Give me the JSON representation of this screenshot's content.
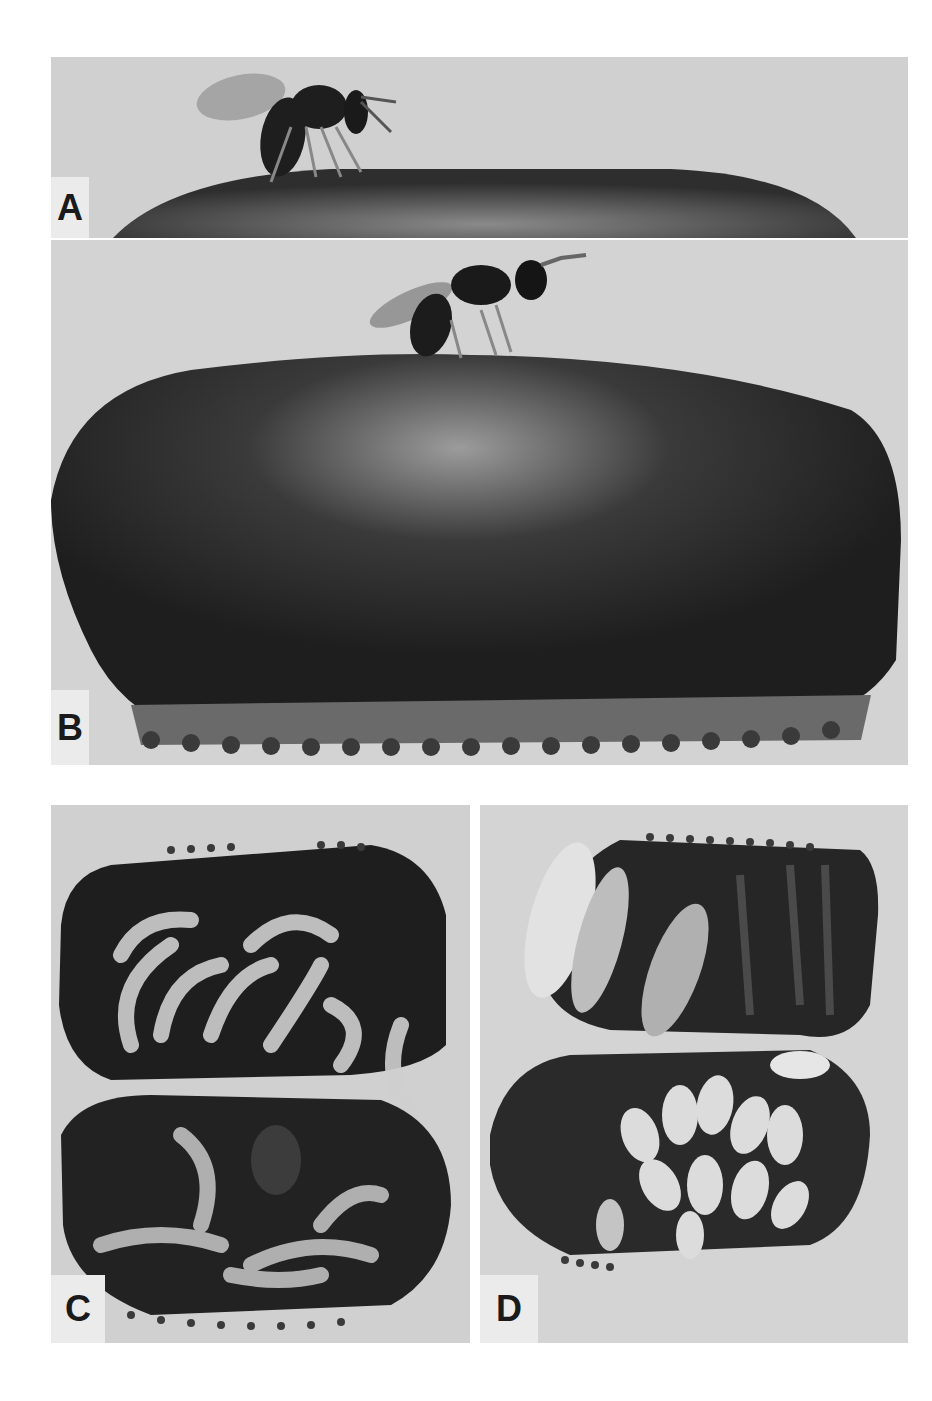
{
  "figure": {
    "panels": [
      {
        "id": "A",
        "label": "A",
        "content": "Small wasp standing on top of an egg case, ovipositing (low magnification crop)"
      },
      {
        "id": "B",
        "label": "B",
        "content": "Wasp standing on top of a large dark egg case with serrated keel at bottom"
      },
      {
        "id": "C",
        "label": "C",
        "content": "Egg case split open showing pale curved larvae inside both halves"
      },
      {
        "id": "D",
        "label": "D",
        "content": "Egg case split open showing pupae and developing wasps inside both halves"
      }
    ],
    "colors": {
      "background": "#ffffff",
      "photo_bg": "#d2d2d2",
      "label_bg": "#ebebeb",
      "egg_case": "#2a2a2a",
      "larvae": "#d8d8d8"
    }
  }
}
